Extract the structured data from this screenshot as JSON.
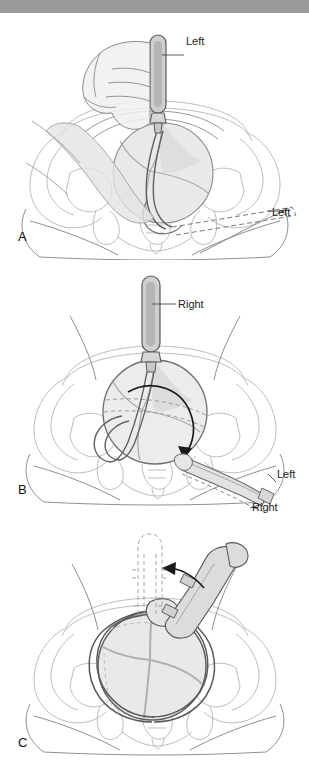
{
  "figure": {
    "background_color": "#ffffff",
    "topbar_color": "#9a9a9a",
    "line_color": "#6f6f6f",
    "bone_line_color": "#bdbdbd",
    "instrument_fill": "#d6d6d6",
    "head_fill": "#e8e8e8",
    "arrow_color": "#1a1a1a"
  },
  "panels": [
    {
      "letter": "A",
      "name": "panel-a",
      "description": "Hand holding left forceps blade inserted into pelvis, dashed outline of handle position",
      "labels": [
        {
          "text": "Left",
          "target": "blade-handle-top"
        },
        {
          "text": "Left",
          "target": "dashed-handle-outline"
        }
      ]
    },
    {
      "letter": "B",
      "name": "panel-b",
      "description": "Right blade vertical with rotation arrow; left handle lies diagonally, dashed right handle below",
      "labels": [
        {
          "text": "Right",
          "target": "blade-handle-vertical"
        },
        {
          "text": "Left",
          "target": "handle-diagonal"
        },
        {
          "text": "Right",
          "target": "dashed-handle-lower"
        }
      ]
    },
    {
      "letter": "C",
      "name": "panel-c",
      "description": "Articulated forceps handles rotated laterally; curved arrow and dashed original vertical position",
      "labels": []
    }
  ],
  "letters": {
    "a": "A",
    "b": "B",
    "c": "C"
  },
  "annotations": {
    "a_left": "Left",
    "a_left_dashed": "Left",
    "b_right": "Right",
    "b_left": "Left",
    "b_right_dashed": "Right"
  }
}
